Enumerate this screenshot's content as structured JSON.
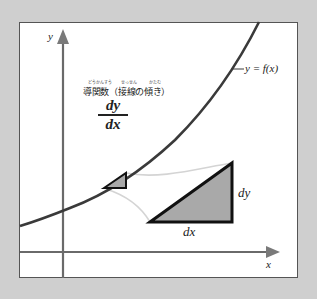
{
  "diagram": {
    "axes": {
      "x_label": "x",
      "y_label": "y"
    },
    "curve_label": "y = f(x)",
    "title": {
      "text": "導関数（接線の傾き）",
      "furigana": [
        "どうかんすう",
        "せっせん",
        "かたむ"
      ]
    },
    "fraction": {
      "numerator": "dy",
      "denominator": "dx"
    },
    "triangle_labels": {
      "vertical": "dy",
      "horizontal": "dx"
    },
    "colors": {
      "background": "#cfcfcf",
      "panel": "#ffffff",
      "curve": "#3a3a3a",
      "axes": "#666666",
      "triangle_fill": "#aaaaaa",
      "triangle_stroke": "#111111",
      "connector": "#d0d0d0"
    }
  }
}
